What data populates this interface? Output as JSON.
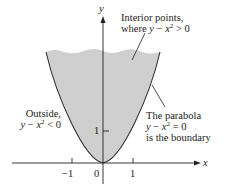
{
  "figure": {
    "type": "region-diagram",
    "colors": {
      "region_fill": "#cfcfcf",
      "curve": "#333333",
      "axis": "#222222",
      "background": "#ffffff"
    },
    "axes": {
      "x_label": "x",
      "y_label": "y",
      "x_ticks": [
        {
          "value": -1,
          "label": "−1"
        },
        {
          "value": 0,
          "label": "0"
        },
        {
          "value": 1,
          "label": "1"
        }
      ],
      "y_ticks": [
        {
          "value": 1,
          "label": "1"
        }
      ]
    },
    "curve": {
      "equation": "y = x^2",
      "description": "parabola boundary"
    },
    "annotations": {
      "interior": {
        "line1": "Interior points,",
        "line2_prefix": "where ",
        "line2_y": "y",
        "line2_minus": " − ",
        "line2_x": "x",
        "line2_exp": "2",
        "line2_rel": " > 0"
      },
      "outside": {
        "line1": "Outside,",
        "line2_y": "y",
        "line2_minus": " − ",
        "line2_x": "x",
        "line2_exp": "2",
        "line2_rel": " < 0"
      },
      "boundary": {
        "line1": "The parabola",
        "line2_y": "y",
        "line2_minus": " − ",
        "line2_x": "x",
        "line2_exp": "2",
        "line2_rel": " = 0",
        "line3": "is the boundary"
      }
    }
  }
}
